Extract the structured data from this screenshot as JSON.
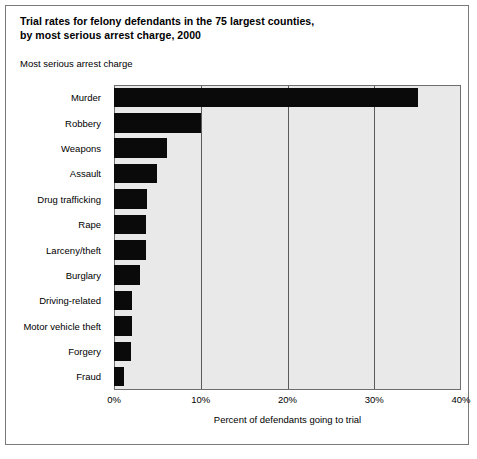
{
  "figure": {
    "title_line1": "Trial rates for felony defendants in the 75 largest counties,",
    "title_line2": "by most serious arrest charge, 2000",
    "axis_group_label": "Most serious arrest charge"
  },
  "chart_data": {
    "type": "bar",
    "orientation": "horizontal",
    "title": "Trial rates for felony defendants in the 75 largest counties, by most serious arrest charge, 2000",
    "subtitle": "Most serious arrest charge",
    "xlabel": "Percent of defendants going to trial",
    "ylabel": "Most serious arrest charge",
    "xlim": [
      0,
      40
    ],
    "xticks": [
      0,
      10,
      20,
      30,
      40
    ],
    "xtick_labels": [
      "0%",
      "10%",
      "20%",
      "30%",
      "40%"
    ],
    "grid": true,
    "legend": "none",
    "bar_color": "#0a0a0a",
    "plot_background": "#e9e9e9",
    "categories": [
      "Murder",
      "Robbery",
      "Weapons",
      "Assault",
      "Drug trafficking",
      "Rape",
      "Larceny/theft",
      "Burglary",
      "Driving-related",
      "Motor vehicle theft",
      "Forgery",
      "Fraud"
    ],
    "values": [
      35.1,
      10.0,
      6.1,
      4.9,
      3.8,
      3.7,
      3.7,
      3.0,
      2.1,
      2.1,
      2.0,
      1.2
    ],
    "value_unit": "percent"
  },
  "footnote": ""
}
